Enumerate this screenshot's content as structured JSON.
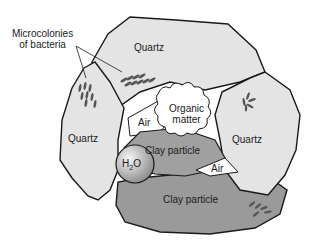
{
  "diagram": {
    "labels": {
      "microcolonies_line1": "Microcolonies",
      "microcolonies_line2": "of bacteria",
      "quartz_top": "Quartz",
      "quartz_left": "Quartz",
      "quartz_right": "Quartz",
      "organic_line1": "Organic",
      "organic_line2": "matter",
      "air_left": "Air",
      "air_right": "Air",
      "clay_upper": "Clay particle",
      "clay_lower": "Clay particle",
      "water": "H",
      "water_sub": "2",
      "water_tail": "O"
    },
    "colors": {
      "quartz_fill": "#e4e4e4",
      "clay_fill": "#9a9a9a",
      "clay_dark": "#8a8a8a",
      "organic_fill": "#ffffff",
      "air_fill": "#ffffff",
      "outline": "#1a1a1a",
      "bacteria": "#555555"
    }
  }
}
